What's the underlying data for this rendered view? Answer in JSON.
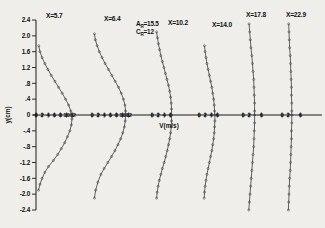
{
  "figure": {
    "background_color": "#efeeea",
    "ink_color": "#1a1a1a",
    "y_axis_label": "y(cm)",
    "x_axis_label": "V(m/s)",
    "annotations": [
      {
        "symbol": "A",
        "subscript": "R",
        "equals": "=",
        "value": "15.5",
        "text": "Aᵣ=15.5"
      },
      {
        "symbol": "C",
        "subscript": "R",
        "equals": "=",
        "value": "12",
        "text": "Cᵣ=12"
      }
    ]
  },
  "chart_data": {
    "type": "line",
    "title": "",
    "xlabel": "V(m/s)",
    "ylabel": "y(cm)",
    "ylim": [
      -2.4,
      2.4
    ],
    "y_ticks": [
      2.4,
      2.0,
      1.6,
      1.2,
      0.8,
      0.4,
      0.0,
      -0.4,
      -0.8,
      -1.2,
      -1.6,
      -2.0,
      -2.4
    ],
    "y_tick_labels": [
      "2.4",
      "2.0",
      "1.6",
      "1.2",
      ".8",
      ".4",
      "0",
      "-.4",
      "-.8",
      "-1.2",
      "-1.6",
      "-2.0",
      "-2.4"
    ],
    "grid": false,
    "legend": "none",
    "series": [
      {
        "name": "X=5.7",
        "label": "X=5.7",
        "x_station": 5.7,
        "axis_ticks": [
          0,
          2,
          4,
          6,
          8,
          10,
          12
        ],
        "axis_tick_labels": [
          "0",
          "2",
          "4",
          "6",
          "8",
          "10",
          "12"
        ],
        "y": [
          1.75,
          1.6,
          1.45,
          1.3,
          1.15,
          1.0,
          0.85,
          0.7,
          0.55,
          0.4,
          0.25,
          0.1,
          0.0,
          -0.1,
          -0.25,
          -0.4,
          -0.55,
          -0.7,
          -0.85,
          -1.0,
          -1.15,
          -1.3,
          -1.45,
          -1.6,
          -1.75,
          -1.9
        ],
        "v": [
          0.9,
          1.3,
          2.0,
          2.9,
          3.9,
          5.0,
          6.2,
          7.4,
          8.6,
          9.7,
          10.7,
          11.4,
          11.7,
          11.8,
          11.6,
          11.1,
          10.3,
          9.4,
          8.3,
          7.1,
          5.7,
          4.1,
          2.9,
          2.0,
          1.3,
          0.8
        ]
      },
      {
        "name": "X=6.4",
        "label": "X=6.4",
        "x_station": 6.4,
        "axis_ticks": [
          0,
          2,
          4,
          6,
          8,
          10,
          12
        ],
        "axis_tick_labels": [
          "0",
          "2",
          "4",
          "6",
          "8",
          "10",
          "12"
        ],
        "y": [
          2.05,
          1.9,
          1.75,
          1.6,
          1.45,
          1.3,
          1.15,
          1.0,
          0.85,
          0.7,
          0.55,
          0.4,
          0.25,
          0.1,
          0.0,
          -0.15,
          -0.3,
          -0.45,
          -0.6,
          -0.75,
          -0.9,
          -1.05,
          -1.2,
          -1.35,
          -1.5,
          -1.7,
          -1.9,
          -2.1
        ],
        "v": [
          0.8,
          1.1,
          1.7,
          2.4,
          3.3,
          4.3,
          5.4,
          6.5,
          7.6,
          8.7,
          9.6,
          10.3,
          10.8,
          11.0,
          11.0,
          10.9,
          10.6,
          10.1,
          9.4,
          8.5,
          7.5,
          6.4,
          5.2,
          4.0,
          2.9,
          1.9,
          1.2,
          0.8
        ]
      },
      {
        "name": "X=10.2",
        "label": "X=10.2",
        "x_station": 10.2,
        "axis_ticks": [
          0,
          2,
          4,
          6
        ],
        "axis_tick_labels": [
          "0",
          "2",
          "4",
          "6"
        ],
        "y": [
          2.1,
          1.95,
          1.8,
          1.65,
          1.5,
          1.35,
          1.2,
          1.05,
          0.9,
          0.75,
          0.6,
          0.45,
          0.3,
          0.15,
          0.0,
          -0.15,
          -0.3,
          -0.45,
          -0.6,
          -0.75,
          -0.9,
          -1.05,
          -1.2,
          -1.35,
          -1.5,
          -1.65,
          -1.8,
          -1.95,
          -2.1
        ],
        "v": [
          1.5,
          1.8,
          2.1,
          2.5,
          2.9,
          3.4,
          3.9,
          4.4,
          4.9,
          5.4,
          5.8,
          6.1,
          6.3,
          6.4,
          6.4,
          6.4,
          6.3,
          6.1,
          5.8,
          5.4,
          5.0,
          4.5,
          4.0,
          3.4,
          2.9,
          2.4,
          2.0,
          1.7,
          1.5
        ]
      },
      {
        "name": "X=14.0",
        "label": "X=14.0",
        "x_station": 14.0,
        "axis_ticks": [
          0,
          2,
          4,
          6
        ],
        "axis_tick_labels": [
          "0",
          "2",
          "4",
          "6"
        ],
        "y": [
          1.75,
          1.6,
          1.45,
          1.3,
          1.15,
          1.0,
          0.85,
          0.7,
          0.55,
          0.4,
          0.25,
          0.1,
          0.0,
          -0.15,
          -0.3,
          -0.45,
          -0.6,
          -0.75,
          -0.9,
          -1.05,
          -1.2,
          -1.35,
          -1.5,
          -1.65,
          -1.8,
          -1.95,
          -2.1
        ],
        "v": [
          1.8,
          2.0,
          2.3,
          2.6,
          3.0,
          3.4,
          3.8,
          4.2,
          4.5,
          4.8,
          5.0,
          5.1,
          5.2,
          5.2,
          5.1,
          5.0,
          4.8,
          4.5,
          4.2,
          3.8,
          3.4,
          3.0,
          2.6,
          2.3,
          2.0,
          1.8,
          1.7
        ]
      },
      {
        "name": "X=17.8",
        "label": "X=17.8",
        "x_station": 17.8,
        "axis_ticks": [
          0,
          2,
          6
        ],
        "axis_tick_labels": [
          "0",
          "2",
          "6"
        ],
        "y": [
          2.3,
          2.1,
          1.9,
          1.7,
          1.5,
          1.3,
          1.1,
          0.9,
          0.7,
          0.5,
          0.3,
          0.1,
          0.0,
          -0.2,
          -0.4,
          -0.6,
          -0.8,
          -1.0,
          -1.2,
          -1.4,
          -1.6,
          -1.8,
          -2.0,
          -2.2,
          -2.4
        ],
        "v": [
          2.0,
          2.2,
          2.4,
          2.6,
          2.9,
          3.1,
          3.3,
          3.5,
          3.6,
          3.7,
          3.8,
          3.8,
          3.8,
          3.8,
          3.7,
          3.6,
          3.5,
          3.3,
          3.1,
          2.9,
          2.7,
          2.5,
          2.3,
          2.1,
          1.9
        ]
      },
      {
        "name": "X=22.9",
        "label": "X=22.9",
        "x_station": 22.9,
        "axis_ticks": [
          0,
          2,
          6
        ],
        "axis_tick_labels": [
          "0",
          "2",
          "6"
        ],
        "y": [
          2.3,
          2.1,
          1.9,
          1.7,
          1.5,
          1.3,
          1.1,
          0.9,
          0.7,
          0.5,
          0.3,
          0.1,
          0.0,
          -0.2,
          -0.4,
          -0.6,
          -0.8,
          -1.0,
          -1.2,
          -1.4,
          -1.6,
          -1.8,
          -2.0,
          -2.2,
          -2.4
        ],
        "v": [
          2.2,
          2.3,
          2.4,
          2.5,
          2.7,
          2.8,
          2.9,
          3.0,
          3.1,
          3.1,
          3.2,
          3.2,
          3.2,
          3.2,
          3.1,
          3.1,
          3.0,
          2.9,
          2.8,
          2.7,
          2.5,
          2.4,
          2.3,
          2.2,
          2.1
        ]
      }
    ]
  }
}
